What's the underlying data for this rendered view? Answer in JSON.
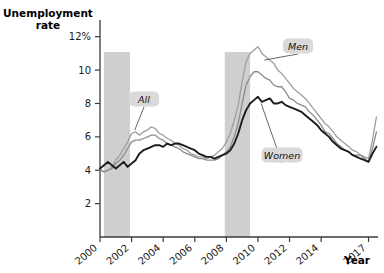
{
  "chart_data": {
    "type": "line",
    "title": "",
    "ylabel": "Unemployment rate",
    "xlabel": "Year",
    "ylim": [
      0,
      13
    ],
    "xlim": [
      2000,
      2017.6
    ],
    "grid": false,
    "legend_position": "inline-callouts",
    "ytick_labels": [
      "12%",
      "10",
      "8",
      "6",
      "4",
      "2"
    ],
    "ytick_values": [
      12,
      10,
      8,
      6,
      4,
      2
    ],
    "xtick_labels": [
      "2000",
      "2002",
      "2004",
      "2006",
      "2008",
      "2010",
      "2012",
      "2014",
      "2017"
    ],
    "xtick_values": [
      2000,
      2002,
      2004,
      2006,
      2008,
      2010,
      2012,
      2014,
      2017
    ],
    "annotations": [
      {
        "label": "All",
        "target_series": "All",
        "at_x": 2002.2,
        "at_y": 6.4
      },
      {
        "label": "Men",
        "target_series": "Men",
        "at_x": 2010.4,
        "at_y": 10.6
      },
      {
        "label": "Women",
        "target_series": "Women",
        "at_x": 2010.2,
        "at_y": 8.0
      }
    ],
    "shaded_regions": [
      {
        "name": "recession-2001",
        "x0": 2000.25,
        "x1": 2001.9
      },
      {
        "name": "recession-2008",
        "x0": 2007.9,
        "x1": 2009.5
      }
    ],
    "series": [
      {
        "name": "Men",
        "color": "#9e9e9e",
        "x": [
          2000.0,
          2000.25,
          2000.5,
          2000.75,
          2001.0,
          2001.25,
          2001.5,
          2001.75,
          2002.0,
          2002.25,
          2002.5,
          2002.75,
          2003.0,
          2003.25,
          2003.5,
          2003.75,
          2004.0,
          2004.25,
          2004.5,
          2004.75,
          2005.0,
          2005.25,
          2005.5,
          2005.75,
          2006.0,
          2006.25,
          2006.5,
          2006.75,
          2007.0,
          2007.25,
          2007.5,
          2007.75,
          2008.0,
          2008.25,
          2008.5,
          2008.75,
          2009.0,
          2009.25,
          2009.5,
          2009.75,
          2010.0,
          2010.25,
          2010.5,
          2010.75,
          2011.0,
          2011.25,
          2011.5,
          2011.75,
          2012.0,
          2012.25,
          2012.5,
          2012.75,
          2013.0,
          2013.25,
          2013.5,
          2013.75,
          2014.0,
          2014.25,
          2014.5,
          2014.75,
          2015.0,
          2015.25,
          2015.5,
          2015.75,
          2016.0,
          2016.25,
          2016.5,
          2016.75,
          2017.0,
          2017.25,
          2017.5
        ],
        "y": [
          4.1,
          3.9,
          4.0,
          4.2,
          4.6,
          4.9,
          5.3,
          5.7,
          6.2,
          6.3,
          6.1,
          6.3,
          6.4,
          6.6,
          6.5,
          6.2,
          6.1,
          5.9,
          5.8,
          5.6,
          5.5,
          5.3,
          5.2,
          5.0,
          4.9,
          4.8,
          4.8,
          4.7,
          4.8,
          4.9,
          5.1,
          5.3,
          5.7,
          6.2,
          7.0,
          7.9,
          9.3,
          10.5,
          11.0,
          11.2,
          11.4,
          11.0,
          10.8,
          10.6,
          10.4,
          10.0,
          9.8,
          9.5,
          9.2,
          8.9,
          8.7,
          8.5,
          8.3,
          8.0,
          7.7,
          7.4,
          7.1,
          6.8,
          6.6,
          6.3,
          6.0,
          5.8,
          5.6,
          5.4,
          5.2,
          5.1,
          4.9,
          4.8,
          4.7,
          5.8,
          7.2
        ]
      },
      {
        "name": "All",
        "color": "#8c8c8c",
        "x": [
          2000.0,
          2000.25,
          2000.5,
          2000.75,
          2001.0,
          2001.25,
          2001.5,
          2001.75,
          2002.0,
          2002.25,
          2002.5,
          2002.75,
          2003.0,
          2003.25,
          2003.5,
          2003.75,
          2004.0,
          2004.25,
          2004.5,
          2004.75,
          2005.0,
          2005.25,
          2005.5,
          2005.75,
          2006.0,
          2006.25,
          2006.5,
          2006.75,
          2007.0,
          2007.25,
          2007.5,
          2007.75,
          2008.0,
          2008.25,
          2008.5,
          2008.75,
          2009.0,
          2009.25,
          2009.5,
          2009.75,
          2010.0,
          2010.25,
          2010.5,
          2010.75,
          2011.0,
          2011.25,
          2011.5,
          2011.75,
          2012.0,
          2012.25,
          2012.5,
          2012.75,
          2013.0,
          2013.25,
          2013.5,
          2013.75,
          2014.0,
          2014.25,
          2014.5,
          2014.75,
          2015.0,
          2015.25,
          2015.5,
          2015.75,
          2016.0,
          2016.25,
          2016.5,
          2016.75,
          2017.0,
          2017.25,
          2017.5
        ],
        "y": [
          4.0,
          3.9,
          4.0,
          4.1,
          4.4,
          4.6,
          4.9,
          5.3,
          5.7,
          5.8,
          5.8,
          5.9,
          6.0,
          6.1,
          6.1,
          5.9,
          5.8,
          5.6,
          5.5,
          5.4,
          5.3,
          5.1,
          5.0,
          4.9,
          4.8,
          4.7,
          4.7,
          4.6,
          4.6,
          4.6,
          4.7,
          4.9,
          5.1,
          5.4,
          6.0,
          6.8,
          8.0,
          9.1,
          9.6,
          9.9,
          9.9,
          9.7,
          9.5,
          9.4,
          9.1,
          9.0,
          9.0,
          8.7,
          8.3,
          8.2,
          8.0,
          7.9,
          7.8,
          7.5,
          7.3,
          7.0,
          6.7,
          6.3,
          6.2,
          5.9,
          5.6,
          5.4,
          5.2,
          5.1,
          4.9,
          4.9,
          4.9,
          4.7,
          4.5,
          5.3,
          6.3
        ]
      },
      {
        "name": "Women",
        "color": "#1c1c1c",
        "x": [
          2000.0,
          2000.25,
          2000.5,
          2000.75,
          2001.0,
          2001.25,
          2001.5,
          2001.75,
          2002.0,
          2002.25,
          2002.5,
          2002.75,
          2003.0,
          2003.25,
          2003.5,
          2003.75,
          2004.0,
          2004.25,
          2004.5,
          2004.75,
          2005.0,
          2005.25,
          2005.5,
          2005.75,
          2006.0,
          2006.25,
          2006.5,
          2006.75,
          2007.0,
          2007.25,
          2007.5,
          2007.75,
          2008.0,
          2008.25,
          2008.5,
          2008.75,
          2009.0,
          2009.25,
          2009.5,
          2009.75,
          2010.0,
          2010.25,
          2010.5,
          2010.75,
          2011.0,
          2011.25,
          2011.5,
          2011.75,
          2012.0,
          2012.25,
          2012.5,
          2012.75,
          2013.0,
          2013.25,
          2013.5,
          2013.75,
          2014.0,
          2014.25,
          2014.5,
          2014.75,
          2015.0,
          2015.25,
          2015.5,
          2015.75,
          2016.0,
          2016.25,
          2016.5,
          2016.75,
          2017.0,
          2017.25,
          2017.5
        ],
        "y": [
          4.1,
          4.3,
          4.5,
          4.3,
          4.1,
          4.3,
          4.5,
          4.2,
          4.4,
          4.6,
          5.0,
          5.2,
          5.3,
          5.4,
          5.5,
          5.5,
          5.4,
          5.6,
          5.5,
          5.6,
          5.6,
          5.5,
          5.4,
          5.3,
          5.2,
          5.0,
          4.9,
          4.8,
          4.8,
          4.7,
          4.8,
          4.9,
          5.0,
          5.2,
          5.6,
          6.2,
          7.0,
          7.6,
          8.0,
          8.2,
          8.4,
          8.1,
          8.2,
          8.3,
          8.0,
          8.0,
          8.1,
          7.9,
          7.8,
          7.7,
          7.6,
          7.5,
          7.3,
          7.1,
          6.9,
          6.7,
          6.4,
          6.2,
          6.0,
          5.7,
          5.5,
          5.3,
          5.2,
          5.1,
          4.9,
          4.8,
          4.7,
          4.6,
          4.5,
          5.0,
          5.4
        ]
      }
    ]
  },
  "theme": {
    "band_color": "#cfcfcf",
    "axis_color": "#3a3a3a",
    "callout_bg": "#d9d9d9",
    "background": "#ffffff"
  },
  "labels": {
    "y_axis_title_line1": "Unemployment",
    "y_axis_title_line2": "rate",
    "x_axis_title": "Year"
  }
}
